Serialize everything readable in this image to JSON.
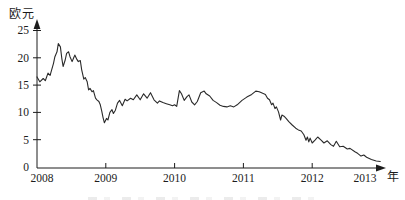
{
  "figure": {
    "y_axis_unit_label": "欧元",
    "x_axis_unit_label": "年"
  },
  "chart_data": {
    "type": "line",
    "title": "",
    "ylabel": "欧元",
    "xlabel": "年",
    "ylim": [
      0,
      25
    ],
    "xlim": [
      2008,
      2013.1
    ],
    "y_ticks": [
      0,
      5,
      10,
      15,
      20,
      25
    ],
    "x_ticks": [
      2008,
      2009,
      2010,
      2011,
      2012,
      2013
    ],
    "grid": false,
    "legend_position": "none",
    "line_color": "#2a2a2a",
    "axis_color": "#1c1c1c",
    "background_color": "#ffffff",
    "series": [
      {
        "name": "price-eur",
        "points": [
          [
            2008.0,
            16.5
          ],
          [
            2008.04,
            15.6
          ],
          [
            2008.09,
            16.2
          ],
          [
            2008.12,
            15.8
          ],
          [
            2008.16,
            17.2
          ],
          [
            2008.19,
            16.8
          ],
          [
            2008.24,
            19.0
          ],
          [
            2008.26,
            20.2
          ],
          [
            2008.29,
            21.1
          ],
          [
            2008.31,
            22.6
          ],
          [
            2008.34,
            22.0
          ],
          [
            2008.36,
            19.9
          ],
          [
            2008.38,
            18.4
          ],
          [
            2008.41,
            19.6
          ],
          [
            2008.43,
            20.8
          ],
          [
            2008.46,
            21.1
          ],
          [
            2008.48,
            20.2
          ],
          [
            2008.51,
            19.3
          ],
          [
            2008.53,
            19.9
          ],
          [
            2008.55,
            20.5
          ],
          [
            2008.58,
            19.7
          ],
          [
            2008.6,
            19.3
          ],
          [
            2008.63,
            19.5
          ],
          [
            2008.65,
            17.8
          ],
          [
            2008.68,
            16.1
          ],
          [
            2008.7,
            16.4
          ],
          [
            2008.73,
            15.6
          ],
          [
            2008.75,
            14.1
          ],
          [
            2008.77,
            14.4
          ],
          [
            2008.8,
            13.8
          ],
          [
            2008.82,
            14.0
          ],
          [
            2008.85,
            12.6
          ],
          [
            2008.87,
            12.3
          ],
          [
            2008.9,
            12.0
          ],
          [
            2008.92,
            11.4
          ],
          [
            2008.94,
            10.3
          ],
          [
            2008.96,
            9.1
          ],
          [
            2008.98,
            8.1
          ],
          [
            2009.01,
            8.9
          ],
          [
            2009.03,
            8.6
          ],
          [
            2009.06,
            10.0
          ],
          [
            2009.09,
            10.5
          ],
          [
            2009.11,
            9.8
          ],
          [
            2009.14,
            10.4
          ],
          [
            2009.17,
            11.7
          ],
          [
            2009.2,
            12.2
          ],
          [
            2009.24,
            11.2
          ],
          [
            2009.28,
            12.4
          ],
          [
            2009.31,
            12.1
          ],
          [
            2009.36,
            12.6
          ],
          [
            2009.4,
            12.3
          ],
          [
            2009.45,
            13.2
          ],
          [
            2009.5,
            12.3
          ],
          [
            2009.55,
            13.4
          ],
          [
            2009.6,
            12.6
          ],
          [
            2009.65,
            13.6
          ],
          [
            2009.7,
            12.3
          ],
          [
            2009.75,
            11.7
          ],
          [
            2009.78,
            12.1
          ],
          [
            2009.83,
            11.8
          ],
          [
            2009.88,
            11.6
          ],
          [
            2009.93,
            11.4
          ],
          [
            2009.97,
            11.2
          ],
          [
            2010.0,
            11.4
          ],
          [
            2010.03,
            11.1
          ],
          [
            2010.07,
            14.0
          ],
          [
            2010.1,
            13.4
          ],
          [
            2010.14,
            12.2
          ],
          [
            2010.18,
            12.9
          ],
          [
            2010.21,
            13.2
          ],
          [
            2010.25,
            11.9
          ],
          [
            2010.29,
            11.4
          ],
          [
            2010.33,
            12.0
          ],
          [
            2010.38,
            13.6
          ],
          [
            2010.43,
            13.9
          ],
          [
            2010.46,
            13.4
          ],
          [
            2010.51,
            13.0
          ],
          [
            2010.56,
            12.2
          ],
          [
            2010.61,
            11.8
          ],
          [
            2010.66,
            11.3
          ],
          [
            2010.71,
            11.1
          ],
          [
            2010.76,
            11.0
          ],
          [
            2010.81,
            11.2
          ],
          [
            2010.86,
            11.0
          ],
          [
            2010.91,
            11.4
          ],
          [
            2010.98,
            12.2
          ],
          [
            2011.05,
            12.8
          ],
          [
            2011.12,
            13.3
          ],
          [
            2011.18,
            13.9
          ],
          [
            2011.23,
            13.8
          ],
          [
            2011.28,
            13.5
          ],
          [
            2011.32,
            13.3
          ],
          [
            2011.35,
            12.6
          ],
          [
            2011.38,
            12.3
          ],
          [
            2011.41,
            11.4
          ],
          [
            2011.43,
            11.7
          ],
          [
            2011.46,
            10.7
          ],
          [
            2011.48,
            11.0
          ],
          [
            2011.51,
            10.1
          ],
          [
            2011.54,
            8.6
          ],
          [
            2011.56,
            9.5
          ],
          [
            2011.59,
            9.3
          ],
          [
            2011.62,
            8.9
          ],
          [
            2011.66,
            8.3
          ],
          [
            2011.71,
            7.7
          ],
          [
            2011.76,
            7.1
          ],
          [
            2011.8,
            6.8
          ],
          [
            2011.84,
            6.6
          ],
          [
            2011.88,
            5.9
          ],
          [
            2011.91,
            4.9
          ],
          [
            2011.93,
            5.5
          ],
          [
            2011.95,
            4.6
          ],
          [
            2011.97,
            5.3
          ],
          [
            2012.0,
            4.4
          ],
          [
            2012.04,
            4.9
          ],
          [
            2012.08,
            5.5
          ],
          [
            2012.13,
            4.9
          ],
          [
            2012.17,
            4.4
          ],
          [
            2012.22,
            4.8
          ],
          [
            2012.27,
            4.1
          ],
          [
            2012.31,
            3.8
          ],
          [
            2012.35,
            4.7
          ],
          [
            2012.4,
            3.7
          ],
          [
            2012.45,
            3.8
          ],
          [
            2012.51,
            3.3
          ],
          [
            2012.55,
            3.4
          ],
          [
            2012.62,
            2.8
          ],
          [
            2012.66,
            2.5
          ],
          [
            2012.71,
            2.0
          ],
          [
            2012.75,
            2.2
          ],
          [
            2012.79,
            1.8
          ],
          [
            2012.86,
            1.4
          ],
          [
            2012.93,
            1.1
          ],
          [
            2012.99,
            1.0
          ]
        ]
      }
    ]
  }
}
